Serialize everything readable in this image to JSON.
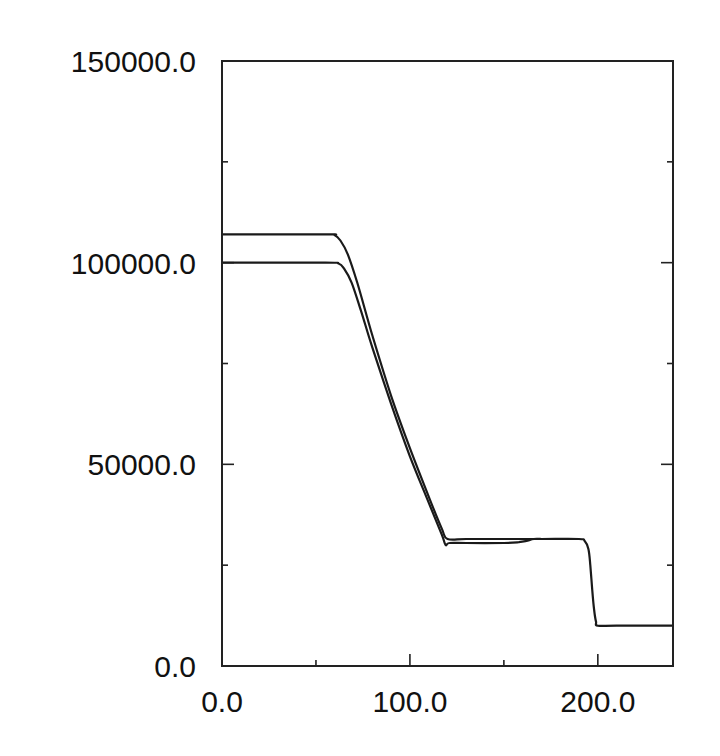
{
  "chart_data": {
    "type": "line",
    "title": "",
    "xlabel": "",
    "ylabel": "",
    "xlim": [
      0,
      240
    ],
    "ylim": [
      0,
      150000
    ],
    "grid": false,
    "legend": null,
    "x_ticks": [
      0,
      100,
      200
    ],
    "x_tick_labels": [
      "0.0",
      "100.0",
      "200.0"
    ],
    "x_minor_ticks": [
      50,
      150
    ],
    "y_ticks": [
      0,
      50000,
      100000,
      150000
    ],
    "y_tick_labels": [
      "0.0",
      "50000.0",
      "100000.0",
      "150000.0"
    ],
    "y_minor_ticks": [
      25000,
      75000,
      125000
    ],
    "series": [
      {
        "name": "upper curve",
        "x": [
          0,
          55,
          60,
          63,
          67,
          72,
          80,
          90,
          100,
          110,
          117,
          120,
          130,
          150,
          170,
          190,
          193,
          195,
          196,
          197,
          198,
          199,
          200,
          210,
          240
        ],
        "y": [
          107000,
          107000,
          106800,
          105500,
          102000,
          95000,
          82000,
          67000,
          54000,
          42000,
          34000,
          31500,
          31500,
          31500,
          31500,
          31500,
          31000,
          29000,
          25000,
          19000,
          14000,
          11000,
          10000,
          10000,
          10000
        ]
      },
      {
        "name": "lower curve",
        "x": [
          0,
          55,
          62,
          65,
          69,
          74,
          80,
          90,
          100,
          110,
          117,
          119,
          121,
          130,
          150,
          158,
          162,
          166,
          170
        ],
        "y": [
          100000,
          100000,
          99800,
          98500,
          95000,
          88000,
          79000,
          65000,
          52000,
          40500,
          32500,
          30000,
          30500,
          30500,
          30500,
          30700,
          31000,
          31500,
          31500
        ]
      }
    ]
  }
}
